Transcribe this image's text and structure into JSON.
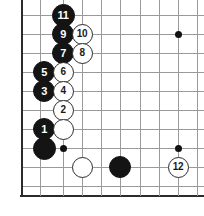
{
  "figure": {
    "kind": "go-board-diagram",
    "width_px": 204,
    "height_px": 216,
    "colors": {
      "background": "#ffffff",
      "grid_line": "#9a9a9a",
      "board_edge": "#2b2b2b",
      "black_stone": "#141414",
      "white_stone": "#ffffff",
      "black_label_text": "#ffffff",
      "white_label_text": "#1a1a1a",
      "star_point": "#111111"
    }
  },
  "board": {
    "visible_columns_px": [
      21,
      40,
      63,
      82,
      101,
      120,
      140,
      159,
      178,
      197
    ],
    "visible_rows_px": [
      15,
      34,
      53,
      72,
      91,
      110,
      129,
      148,
      167,
      186
    ],
    "left_edge_px": 21,
    "bottom_edge_px": 195,
    "edges": [
      "left",
      "bottom"
    ],
    "star_points": [
      {
        "name": "star-lower-left",
        "x": 63,
        "y": 148
      },
      {
        "name": "star-lower-right",
        "x": 178,
        "y": 148
      },
      {
        "name": "star-upper-right",
        "x": 178,
        "y": 34
      }
    ]
  },
  "stones": [
    {
      "id": "stone-11",
      "color": "black",
      "label": "11",
      "x": 63,
      "y": 15,
      "radius": 11.5,
      "font_size": 11
    },
    {
      "id": "stone-9",
      "color": "black",
      "label": "9",
      "x": 63,
      "y": 34,
      "radius": 11.0,
      "font_size": 11
    },
    {
      "id": "stone-10",
      "color": "white",
      "label": "10",
      "x": 82,
      "y": 34,
      "radius": 10.5,
      "font_size": 10
    },
    {
      "id": "stone-7",
      "color": "black",
      "label": "7",
      "x": 63,
      "y": 53,
      "radius": 11.0,
      "font_size": 11
    },
    {
      "id": "stone-8",
      "color": "white",
      "label": "8",
      "x": 82,
      "y": 53,
      "radius": 10.5,
      "font_size": 10
    },
    {
      "id": "stone-5",
      "color": "black",
      "label": "5",
      "x": 44,
      "y": 72,
      "radius": 11.0,
      "font_size": 11
    },
    {
      "id": "stone-6",
      "color": "white",
      "label": "6",
      "x": 63,
      "y": 72,
      "radius": 10.5,
      "font_size": 10
    },
    {
      "id": "stone-3",
      "color": "black",
      "label": "3",
      "x": 44,
      "y": 91,
      "radius": 11.0,
      "font_size": 11
    },
    {
      "id": "stone-4",
      "color": "white",
      "label": "4",
      "x": 63,
      "y": 91,
      "radius": 10.5,
      "font_size": 10
    },
    {
      "id": "stone-2",
      "color": "white",
      "label": "2",
      "x": 63,
      "y": 110,
      "radius": 10.5,
      "font_size": 10
    },
    {
      "id": "stone-1",
      "color": "black",
      "label": "1",
      "x": 44,
      "y": 129,
      "radius": 11.0,
      "font_size": 11
    },
    {
      "id": "stone-white-a",
      "color": "white",
      "label": "",
      "x": 63,
      "y": 129,
      "radius": 10.5,
      "font_size": 10
    },
    {
      "id": "stone-black-a",
      "color": "black",
      "label": "",
      "x": 44,
      "y": 148,
      "radius": 11.5,
      "font_size": 11
    },
    {
      "id": "stone-white-b",
      "color": "white",
      "label": "",
      "x": 82,
      "y": 167,
      "radius": 10.5,
      "font_size": 10
    },
    {
      "id": "stone-black-b",
      "color": "black",
      "label": "",
      "x": 120,
      "y": 167,
      "radius": 11.0,
      "font_size": 11
    },
    {
      "id": "stone-12",
      "color": "white",
      "label": "12",
      "x": 178,
      "y": 167,
      "radius": 10.5,
      "font_size": 10
    }
  ]
}
